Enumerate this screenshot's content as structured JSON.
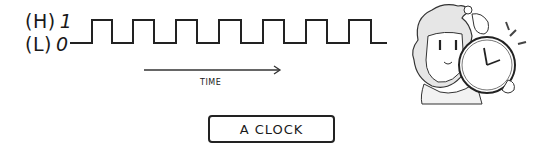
{
  "labels": {
    "high_state": "(H)",
    "high_value": "1",
    "low_state": "(L)",
    "low_value": "0"
  },
  "axis": {
    "time_label": "TIME"
  },
  "caption": "A CLOCK",
  "signal": {
    "type": "square_wave",
    "pulses": 7,
    "levels": [
      "0",
      "1"
    ],
    "color": "#222222"
  },
  "illustration": {
    "description": "anime-girl-holding-clock-icon"
  }
}
